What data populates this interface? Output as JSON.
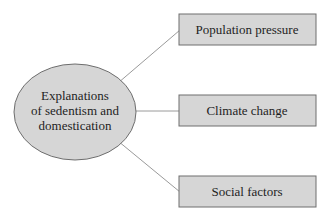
{
  "diagram": {
    "center": {
      "lines": [
        "Explanations",
        "of sedentism and",
        "domestication"
      ]
    },
    "branches": [
      {
        "label": "Population pressure"
      },
      {
        "label": "Climate change"
      },
      {
        "label": "Social factors"
      }
    ],
    "colors": {
      "node_fill": "#d6d6d6",
      "node_stroke": "#6e6e6e",
      "connector": "#9a9a9a",
      "text": "#1e1e1e"
    }
  }
}
